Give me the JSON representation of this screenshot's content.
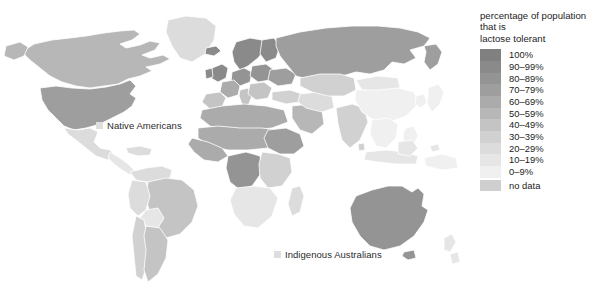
{
  "figure": {
    "type": "choropleth-world-map",
    "background_color": "#ffffff"
  },
  "legend": {
    "title": "percentage of population\nthat is\nlactose tolerant",
    "title_lines": [
      "percentage of population",
      "that is",
      "lactose tolerant"
    ],
    "entries": [
      {
        "label": "100%",
        "color": "#808080"
      },
      {
        "label": "90–99%",
        "color": "#8a8a8a"
      },
      {
        "label": "80–89%",
        "color": "#949494"
      },
      {
        "label": "70–79%",
        "color": "#9e9e9e"
      },
      {
        "label": "60–69%",
        "color": "#ababab"
      },
      {
        "label": "50–59%",
        "color": "#b7b7b7"
      },
      {
        "label": "40–49%",
        "color": "#c4c4c4"
      },
      {
        "label": "30–39%",
        "color": "#d1d1d1"
      },
      {
        "label": "20–29%",
        "color": "#dcdcdc"
      },
      {
        "label": "10–19%",
        "color": "#e6e6e6"
      },
      {
        "label": "0–9%",
        "color": "#f0f0f0"
      },
      {
        "label": "no data",
        "color": "#cfcfcf"
      }
    ]
  },
  "map_annotations": [
    {
      "id": "native-americans",
      "text": "Native Americans",
      "chip_color": "#dedede"
    },
    {
      "id": "indigenous-australians",
      "text": "Indigenous Australians",
      "chip_color": "#dedede"
    }
  ],
  "chart_data": {
    "type": "heatmap",
    "title": "percentage of population that is lactose tolerant",
    "xlabel": "",
    "ylabel": "",
    "legend_position": "right",
    "grid": false,
    "value_unit": "percent of population lactose tolerant",
    "bins": [
      {
        "label": "100%",
        "min": 100,
        "max": 100,
        "color": "#808080"
      },
      {
        "label": "90–99%",
        "min": 90,
        "max": 99,
        "color": "#8a8a8a"
      },
      {
        "label": "80–89%",
        "min": 80,
        "max": 89,
        "color": "#949494"
      },
      {
        "label": "70–79%",
        "min": 70,
        "max": 79,
        "color": "#9e9e9e"
      },
      {
        "label": "60–69%",
        "min": 60,
        "max": 69,
        "color": "#ababab"
      },
      {
        "label": "50–59%",
        "min": 50,
        "max": 59,
        "color": "#b7b7b7"
      },
      {
        "label": "40–49%",
        "min": 40,
        "max": 49,
        "color": "#c4c4c4"
      },
      {
        "label": "30–39%",
        "min": 30,
        "max": 39,
        "color": "#d1d1d1"
      },
      {
        "label": "20–29%",
        "min": 20,
        "max": 29,
        "color": "#dcdcdc"
      },
      {
        "label": "10–19%",
        "min": 10,
        "max": 19,
        "color": "#e6e6e6"
      },
      {
        "label": "0–9%",
        "min": 0,
        "max": 9,
        "color": "#f0f0f0"
      },
      {
        "label": "no data",
        "min": null,
        "max": null,
        "color": "#cfcfcf"
      }
    ],
    "regions": [
      {
        "name": "Canada",
        "bin": "50–59%",
        "color": "#b7b7b7"
      },
      {
        "name": "United States",
        "bin": "70–79%",
        "color": "#9e9e9e"
      },
      {
        "name": "Greenland",
        "bin": "20–29%",
        "color": "#dcdcdc"
      },
      {
        "name": "Mexico",
        "bin": "20–29%",
        "color": "#dcdcdc"
      },
      {
        "name": "Central America",
        "bin": "10–19%",
        "color": "#e6e6e6"
      },
      {
        "name": "Caribbean",
        "bin": "20–29%",
        "color": "#dcdcdc"
      },
      {
        "name": "Colombia",
        "bin": "20–29%",
        "color": "#dcdcdc"
      },
      {
        "name": "Venezuela",
        "bin": "20–29%",
        "color": "#dcdcdc"
      },
      {
        "name": "Brazil",
        "bin": "40–49%",
        "color": "#c4c4c4"
      },
      {
        "name": "Peru",
        "bin": "20–29%",
        "color": "#dcdcdc"
      },
      {
        "name": "Bolivia",
        "bin": "10–19%",
        "color": "#e6e6e6"
      },
      {
        "name": "Chile",
        "bin": "30–39%",
        "color": "#d1d1d1"
      },
      {
        "name": "Argentina",
        "bin": "40–49%",
        "color": "#c4c4c4"
      },
      {
        "name": "Scandinavia",
        "bin": "90–99%",
        "color": "#8a8a8a"
      },
      {
        "name": "Ireland",
        "bin": "90–99%",
        "color": "#8a8a8a"
      },
      {
        "name": "United Kingdom",
        "bin": "90–99%",
        "color": "#8a8a8a"
      },
      {
        "name": "Germany",
        "bin": "80–89%",
        "color": "#949494"
      },
      {
        "name": "France",
        "bin": "60–69%",
        "color": "#ababab"
      },
      {
        "name": "Iberia",
        "bin": "40–49%",
        "color": "#c4c4c4"
      },
      {
        "name": "Italy",
        "bin": "40–49%",
        "color": "#c4c4c4"
      },
      {
        "name": "Poland",
        "bin": "80–89%",
        "color": "#949494"
      },
      {
        "name": "Balkans",
        "bin": "40–49%",
        "color": "#c4c4c4"
      },
      {
        "name": "Russia",
        "bin": "70–79%",
        "color": "#9e9e9e"
      },
      {
        "name": "Turkey",
        "bin": "30–39%",
        "color": "#d1d1d1"
      },
      {
        "name": "Middle East",
        "bin": "20–29%",
        "color": "#dcdcdc"
      },
      {
        "name": "Saudi Arabia",
        "bin": "50–59%",
        "color": "#b7b7b7"
      },
      {
        "name": "North Africa",
        "bin": "60–69%",
        "color": "#ababab"
      },
      {
        "name": "Sahel",
        "bin": "60–69%",
        "color": "#ababab"
      },
      {
        "name": "Sudan",
        "bin": "70–79%",
        "color": "#9e9e9e"
      },
      {
        "name": "DR Congo",
        "bin": "80–89%",
        "color": "#949494"
      },
      {
        "name": "East Africa",
        "bin": "30–39%",
        "color": "#d1d1d1"
      },
      {
        "name": "Southern Africa",
        "bin": "10–19%",
        "color": "#e6e6e6"
      },
      {
        "name": "Madagascar",
        "bin": "20–29%",
        "color": "#dcdcdc"
      },
      {
        "name": "Central Asia",
        "bin": "30–39%",
        "color": "#d1d1d1"
      },
      {
        "name": "Iran",
        "bin": "20–29%",
        "color": "#dcdcdc"
      },
      {
        "name": "India",
        "bin": "30–39%",
        "color": "#d1d1d1"
      },
      {
        "name": "Mongolia",
        "bin": "10–19%",
        "color": "#e6e6e6"
      },
      {
        "name": "China",
        "bin": "0–9%",
        "color": "#f0f0f0"
      },
      {
        "name": "Korea",
        "bin": "0–9%",
        "color": "#f0f0f0"
      },
      {
        "name": "Japan",
        "bin": "0–9%",
        "color": "#f0f0f0"
      },
      {
        "name": "Southeast Asia",
        "bin": "0–9%",
        "color": "#f0f0f0"
      },
      {
        "name": "Indonesia",
        "bin": "10–19%",
        "color": "#e6e6e6"
      },
      {
        "name": "Papua New Guinea",
        "bin": "0–9%",
        "color": "#f0f0f0"
      },
      {
        "name": "Australia",
        "bin": "80–89%",
        "color": "#949494"
      },
      {
        "name": "New Zealand",
        "bin": "10–19%",
        "color": "#e6e6e6"
      },
      {
        "name": "Native Americans",
        "bin": "0–9%",
        "color": "#dedede"
      },
      {
        "name": "Indigenous Australians",
        "bin": "0–9%",
        "color": "#dedede"
      }
    ],
    "annotations": [
      "Native Americans",
      "Indigenous Australians"
    ]
  }
}
